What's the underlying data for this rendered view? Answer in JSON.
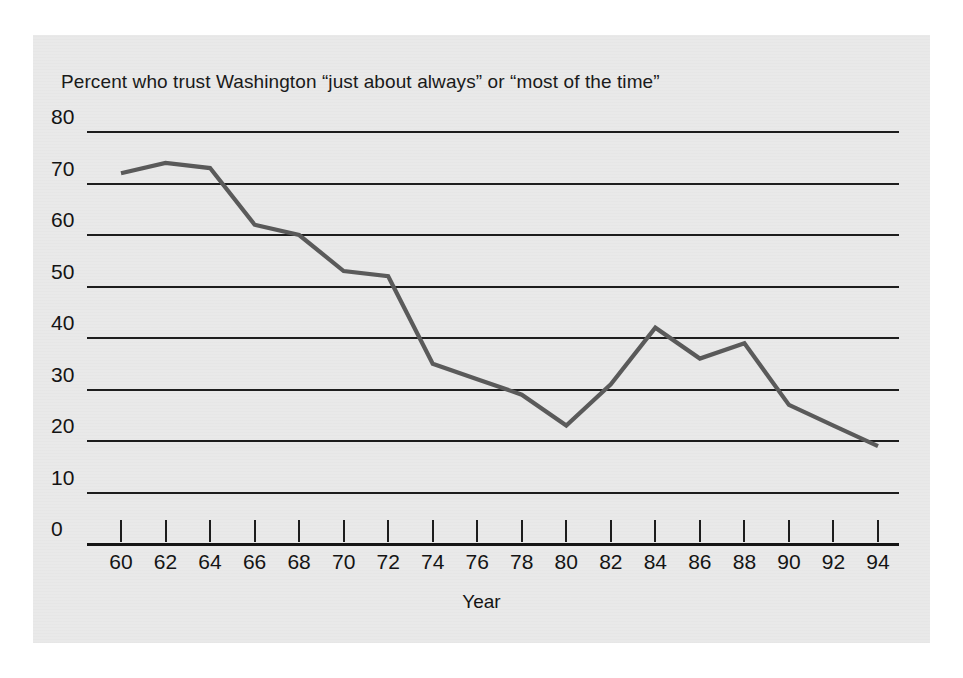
{
  "figure": {
    "background_color": "#e9e9e9",
    "page_background": "#ffffff"
  },
  "chart_data": {
    "type": "line",
    "title": "Percent who trust Washington “just about always” or “most of the time”",
    "xlabel": "Year",
    "ylabel": "",
    "x": [
      60,
      62,
      64,
      66,
      68,
      70,
      72,
      74,
      76,
      78,
      80,
      82,
      84,
      86,
      88,
      90,
      92,
      94
    ],
    "values": [
      72,
      74,
      73,
      62,
      60,
      53,
      52,
      35,
      32,
      29,
      23,
      31,
      42,
      36,
      39,
      27,
      23,
      19
    ],
    "series": [
      {
        "name": "Trust in Washington",
        "color": "#5a5a5a",
        "values": [
          72,
          74,
          73,
          62,
          60,
          53,
          52,
          35,
          32,
          29,
          23,
          31,
          42,
          36,
          39,
          27,
          23,
          19
        ]
      }
    ],
    "xticks": [
      "60",
      "62",
      "64",
      "66",
      "68",
      "70",
      "72",
      "74",
      "76",
      "78",
      "80",
      "82",
      "84",
      "86",
      "88",
      "90",
      "92",
      "94"
    ],
    "yticks": [
      "0",
      "10",
      "20",
      "30",
      "40",
      "50",
      "60",
      "70",
      "80"
    ],
    "ylim": [
      0,
      80
    ],
    "xlim": [
      60,
      94
    ],
    "grid": "horizontal",
    "legend": "none",
    "line_color": "#5a5a5a",
    "axis_color": "#1d1d1d"
  }
}
